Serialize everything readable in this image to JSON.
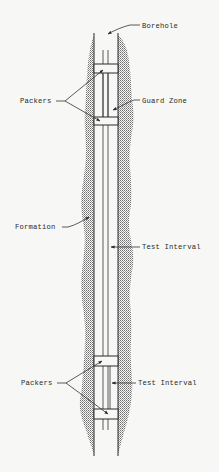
{
  "diagram": {
    "type": "borehole-packer-schematic",
    "colors": {
      "background": "#f7f7f5",
      "ink": "#2a2a2a",
      "hatch": "#8a8a8a"
    },
    "labels": {
      "borehole": "Borehole",
      "packers_top": "Packers",
      "guard_zone": "Guard Zone",
      "formation": "Formation",
      "test_interval_middle": "Test Interval",
      "packers_bottom": "Packers",
      "test_interval_bottom": "Test Interval"
    },
    "components": [
      {
        "name": "Borehole",
        "description": "Vertical borehole walls"
      },
      {
        "name": "Formation",
        "description": "Hatched rock formation surrounding borehole"
      },
      {
        "name": "Packers",
        "count": 4,
        "description": "Two upper and two lower packer seals"
      },
      {
        "name": "Guard Zone",
        "description": "Interval between upper packers"
      },
      {
        "name": "Test Interval",
        "description": "Isolated zone between packers"
      }
    ]
  }
}
